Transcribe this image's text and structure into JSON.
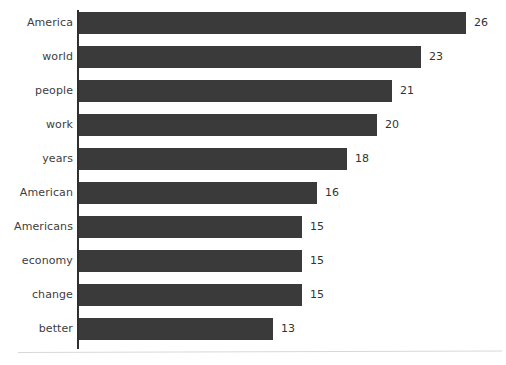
{
  "chart_data": {
    "type": "bar",
    "orientation": "horizontal",
    "title": "",
    "subtitle": "",
    "xlabel": "",
    "ylabel": "",
    "categories": [
      "America",
      "world",
      "people",
      "work",
      "years",
      "American",
      "Americans",
      "economy",
      "change",
      "better"
    ],
    "values": [
      26,
      23,
      21,
      20,
      18,
      16,
      15,
      15,
      15,
      13
    ],
    "series": [
      {
        "name": "count",
        "values": [
          26,
          23,
          21,
          20,
          18,
          16,
          15,
          15,
          15,
          13
        ]
      }
    ],
    "data_labels": [
      "26",
      "23",
      "21",
      "20",
      "18",
      "16",
      "15",
      "15",
      "15",
      "13"
    ],
    "xlim": [
      0,
      26
    ],
    "grid": false,
    "legend": false,
    "legend_position": "none",
    "tick_labels": {
      "x": [],
      "y": [
        "America",
        "world",
        "people",
        "work",
        "years",
        "American",
        "Americans",
        "economy",
        "change",
        "better"
      ]
    },
    "annotations": [],
    "colors": {
      "bar": "#3a3a3a",
      "axis": "#2f2f2f",
      "text": "#3d3d3d",
      "value_text": "#333333",
      "background": "#ffffff",
      "baseline_rule": "#d8d8d8"
    }
  }
}
